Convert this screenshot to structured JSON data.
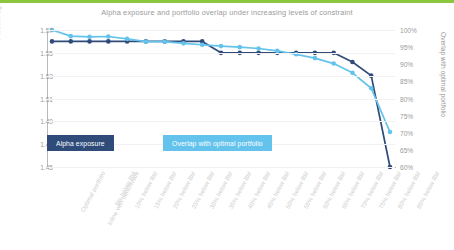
{
  "chart_data": {
    "type": "line",
    "title": "Alpha exposure and portfolio overlap under increasing levels of constraint",
    "xlabel": "",
    "categories": [
      "Optimal portfolio",
      "Inline with benchmark",
      "5% below BM",
      "10% below BM",
      "15% below BM",
      "20% below BM",
      "25% below BM",
      "30% below BM",
      "35% below BM",
      "40% below BM",
      "45% below BM",
      "50% below BM",
      "55% below BM",
      "60% below BM",
      "65% below BM",
      "70% below BM",
      "75% below BM",
      "80% below BM",
      "85% below BM"
    ],
    "grid": true,
    "legend_position": "inside-bottom-left",
    "axes": {
      "left": {
        "label": "Portfolio alpha exposure",
        "ticks": [
          "1.45",
          "1.47",
          "1.49",
          "1.51",
          "1.53",
          "1.55",
          "1.57"
        ],
        "min": 1.45,
        "max": 1.57
      },
      "right": {
        "label": "Overlap with optimal portfolio",
        "ticks": [
          "60%",
          "65%",
          "70%",
          "75%",
          "80%",
          "85%",
          "90%",
          "95%",
          "100%"
        ],
        "min": 60,
        "max": 100
      }
    },
    "series": [
      {
        "name": "Alpha exposure",
        "axis": "left",
        "color": "#2e4b7a",
        "values": [
          1.56,
          1.56,
          1.56,
          1.56,
          1.56,
          1.56,
          1.56,
          1.56,
          1.56,
          1.55,
          1.55,
          1.55,
          1.55,
          1.55,
          1.55,
          1.55,
          1.542,
          1.53,
          1.45
        ]
      },
      {
        "name": "Overlap with optimal portfolio",
        "axis": "right",
        "color": "#64c3ec",
        "values": [
          100.0,
          98.2,
          98.0,
          98.1,
          97.4,
          96.6,
          96.6,
          96.1,
          95.7,
          95.3,
          95.0,
          94.6,
          93.9,
          92.9,
          91.8,
          90.2,
          87.5,
          83.0,
          70.2
        ]
      }
    ]
  },
  "legend": {
    "alpha_label": "Alpha exposure",
    "overlap_label": "Overlap with optimal portfolio"
  },
  "accent": {
    "top_bar": "#8cc63f",
    "navy": "#2e4b7a",
    "light_blue": "#64c3ec"
  }
}
